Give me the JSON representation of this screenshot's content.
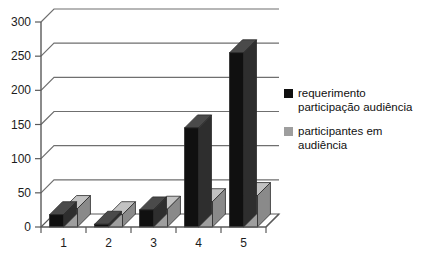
{
  "chart_data": {
    "type": "bar",
    "title": "",
    "subtitle": "",
    "xlabel": "",
    "ylabel": "",
    "categories": [
      "1",
      "2",
      "3",
      "4",
      "5"
    ],
    "series": [
      {
        "name": "requerimento participação audiência",
        "color": "#101010",
        "values": [
          18,
          4,
          25,
          145,
          255
        ]
      },
      {
        "name": "participantes em audiência",
        "color": "#9e9e9e",
        "values": [
          27,
          18,
          26,
          37,
          46
        ]
      }
    ],
    "ylim": [
      0,
      300
    ],
    "yticks": [
      0,
      50,
      100,
      150,
      200,
      250,
      300
    ],
    "ytick_labels": [
      "0",
      "50",
      "100",
      "150",
      "200",
      "250",
      "300"
    ],
    "grid": true,
    "grid_axis": "y",
    "legend_position": "right",
    "style": "3d-column",
    "annotations": []
  },
  "legend": {
    "entries": [
      {
        "swatch_color": "#101010",
        "line1": "requerimento",
        "line2": "participação audiência"
      },
      {
        "swatch_color": "#9e9e9e",
        "line1": "participantes em",
        "line2": "audiência"
      }
    ]
  },
  "axis": {
    "y_tick_labels": [
      "300",
      "250",
      "200",
      "150",
      "100",
      "50",
      "0"
    ],
    "x_tick_labels": [
      "1",
      "2",
      "3",
      "4",
      "5"
    ]
  },
  "colors": {
    "series_1": "#101010",
    "series_1_side": "#2e2e2e",
    "series_1_top": "#4a4a4a",
    "series_2": "#9e9e9e",
    "series_2_side": "#8a8a8a",
    "series_2_top": "#c2c2c2",
    "grid": "#6f6f6f",
    "axis": "#5a5a5a",
    "floor": "#ffffff",
    "background": "#ffffff"
  }
}
